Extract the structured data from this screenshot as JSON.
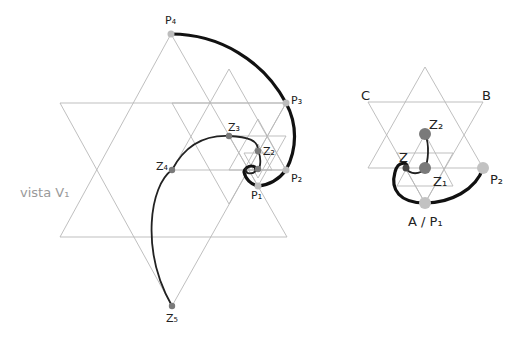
{
  "left_figure": {
    "caption": "vista V₁",
    "labels": {
      "P4": "P₄",
      "P3": "P₃",
      "P2": "P₂",
      "P1": "P₁",
      "Z1": "Z₁",
      "Z2": "Z₂",
      "Z3": "Z₃",
      "Z4": "Z₄",
      "Z5": "Z₅"
    }
  },
  "right_figure": {
    "labels": {
      "C": "C",
      "B": "B",
      "Z2": "Z₂",
      "Z": "Z",
      "Z1": "Z₁",
      "P2": "P₂",
      "AP1": "A / P₁"
    }
  },
  "colors": {
    "grid": "#b8b8b8",
    "curve": "#111111",
    "p_point": "#bdbdbd",
    "z_point": "#7a7a7a",
    "caption": "#9a9a9a"
  }
}
